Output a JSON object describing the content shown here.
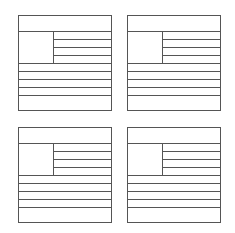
{
  "diagram": {
    "stroke_color": "#555555",
    "background": "#ffffff",
    "layouts": [
      {
        "name": "layout-top-left",
        "x": 18,
        "y": 15,
        "w": 94,
        "h": 96
      },
      {
        "name": "layout-top-right",
        "x": 127,
        "y": 15,
        "w": 94,
        "h": 96
      },
      {
        "name": "layout-bottom-left",
        "x": 18,
        "y": 127,
        "w": 94,
        "h": 96
      },
      {
        "name": "layout-bottom-right",
        "x": 127,
        "y": 127,
        "w": 94,
        "h": 96
      }
    ],
    "structure": {
      "header_height": 16,
      "image_block": {
        "width": 35,
        "height": 32
      },
      "side_lines": 3,
      "full_width_lines": 4
    }
  }
}
